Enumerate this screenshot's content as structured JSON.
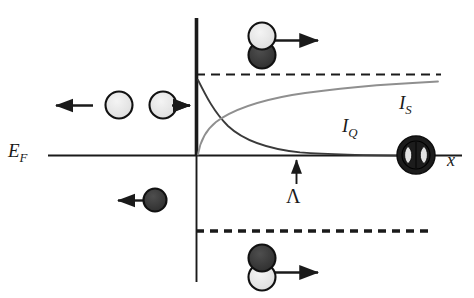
{
  "figure": {
    "background_color": "#ffffff",
    "width": 474,
    "height": 298
  },
  "axes": {
    "x_axis": {
      "label": "x",
      "y_position": 155,
      "x_start": 48,
      "x_end": 462,
      "color": "#1a1a1a"
    },
    "y_axis": {
      "x_position": 196,
      "y_top": 18,
      "y_bottom": 282,
      "color": "#1a1a1a"
    },
    "fermi_level_label": "E_F",
    "fermi_level_label_parts": {
      "base": "E",
      "sub": "F"
    }
  },
  "reference_lines": [
    {
      "name": "upper-gap-line",
      "style": "dashed",
      "y": 74,
      "x_start": 196,
      "x_end": 441,
      "thickness": 2.2,
      "color": "#1a1a1a"
    },
    {
      "name": "lower-gap-line",
      "style": "dashed",
      "y": 231,
      "x_start": 196,
      "x_end": 428,
      "thickness": 3.2,
      "color": "#1a1a1a"
    }
  ],
  "curves": [
    {
      "name": "I_Q",
      "label": "I_Q",
      "label_parts": {
        "base": "I",
        "sub": "Q"
      },
      "label_x": 342,
      "label_y": 116,
      "description": "Quasiparticle current, decays from gap edge toward zero",
      "color": "#3a3a3a",
      "thickness": 1.7
    },
    {
      "name": "I_S",
      "label": "I_S",
      "label_parts": {
        "base": "I",
        "sub": "S"
      },
      "label_x": 399,
      "label_y": 93,
      "description": "Supercurrent, rises from zero toward gap asymptote",
      "color": "#8a8a8a",
      "thickness": 1.7
    }
  ],
  "annotations": [
    {
      "name": "lambda-marker",
      "label": "Λ",
      "arrow_direction": "up",
      "arrow_x": 296,
      "arrow_tip_y": 157,
      "arrow_tail_y": 184,
      "label_x": 286,
      "label_y": 186
    }
  ],
  "particles": [
    {
      "name": "electron-incoming-left",
      "kind": "arrow-only",
      "fill": "light",
      "arrow_direction": "left",
      "x": 72,
      "y": 105
    },
    {
      "name": "electron-left-open",
      "kind": "single-circle",
      "fill": "light",
      "cx": 119,
      "cy": 105,
      "r": 13
    },
    {
      "name": "electron-right-open",
      "kind": "single-circle-with-arrow",
      "fill": "light",
      "cx": 163,
      "cy": 105,
      "r": 13,
      "arrow_direction": "right"
    },
    {
      "name": "hole-reflected",
      "kind": "single-circle-with-arrow",
      "fill": "dark",
      "cx": 155,
      "cy": 200,
      "r": 11,
      "arrow_direction": "left"
    },
    {
      "name": "cooper-pair-top",
      "kind": "stacked-pair",
      "top_fill": "light",
      "bottom_fill": "dark",
      "cx": 262,
      "cy_top": 36,
      "cy_bottom": 55,
      "r": 13,
      "arrow_direction": "right"
    },
    {
      "name": "cooper-pair-bottom",
      "kind": "stacked-pair",
      "top_fill": "dark",
      "bottom_fill": "light",
      "cx": 262,
      "cy_top": 258,
      "cy_bottom": 277,
      "r": 13,
      "arrow_direction": "right"
    },
    {
      "name": "condensate-pair-node",
      "kind": "filled-circle-with-pair-glyph",
      "fill": "dark",
      "cx": 416,
      "cy": 155,
      "r": 19
    }
  ],
  "colors": {
    "ink": "#1a1a1a",
    "curve_dark": "#3a3a3a",
    "curve_light": "#8a8a8a",
    "particle_light_fill": "#e8e8e8",
    "particle_dark_fill": "#3c3c3c",
    "particle_outline": "#111111"
  }
}
